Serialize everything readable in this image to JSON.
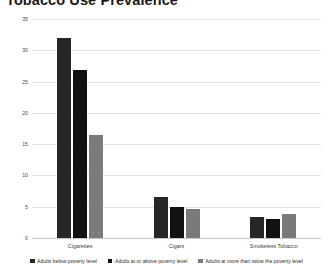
{
  "chart_data": {
    "type": "bar",
    "title": "Tobacco Use Prevalence",
    "xlabel": "",
    "ylabel": "",
    "ylim": [
      0,
      35
    ],
    "yticks": [
      35,
      30,
      25,
      20,
      15,
      10,
      5,
      0
    ],
    "grid": true,
    "legend_position": "bottom",
    "categories": [
      "Cigarettes",
      "Cigars",
      "Smokeless Tobacco"
    ],
    "series": [
      {
        "name": "Adults below poverty level",
        "color": "#262626",
        "values": [
          32.0,
          6.5,
          3.4
        ]
      },
      {
        "name": "Adults at or above poverty level",
        "color": "#121212",
        "values": [
          26.8,
          5.0,
          3.1
        ]
      },
      {
        "name": "Adults at more than twice the poverty level",
        "color": "#7a7a7a",
        "values": [
          16.4,
          4.7,
          3.9
        ]
      }
    ]
  }
}
